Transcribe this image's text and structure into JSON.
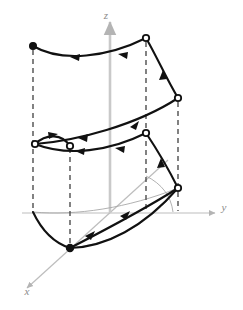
{
  "figure": {
    "title": "",
    "type": "3d-vector-field-surface-diagram",
    "background_color": "#ffffff",
    "curve_color": "#111111",
    "axis_color": "#b4b4b4",
    "dashed_color": "#4d4d4d",
    "thin_guide_color": "#a8a8a8"
  },
  "axes": {
    "z": {
      "label": "z",
      "label_x": 106,
      "label_y": 19,
      "from": [
        110,
        213
      ],
      "to": [
        110,
        22
      ],
      "arrow": "up"
    },
    "y": {
      "label": "y",
      "label_x": 224,
      "label_y": 211,
      "from": [
        22,
        213
      ],
      "to": [
        215,
        213
      ],
      "arrow": "right"
    },
    "x": {
      "label": "x",
      "label_x": 27,
      "label_y": 295,
      "from": [
        168,
        160
      ],
      "to": [
        27,
        288
      ],
      "arrow": "down-left"
    }
  },
  "vertices": [
    {
      "name": "top-left",
      "x": 33,
      "y": 46,
      "style": "filled"
    },
    {
      "name": "top-right",
      "x": 146,
      "y": 38,
      "style": "open"
    },
    {
      "name": "right-upper",
      "x": 178,
      "y": 98,
      "style": "open"
    },
    {
      "name": "mid-left-outer",
      "x": 35,
      "y": 144,
      "style": "open"
    },
    {
      "name": "mid-left-inner",
      "x": 70,
      "y": 146,
      "style": "open"
    },
    {
      "name": "mid-right",
      "x": 146,
      "y": 133,
      "style": "open"
    },
    {
      "name": "right-lower",
      "x": 178,
      "y": 188,
      "style": "open"
    },
    {
      "name": "bottom-front",
      "x": 70,
      "y": 248,
      "style": "filled"
    }
  ],
  "dashed_lines": [
    {
      "name": "dashed-left",
      "x": 33,
      "y1": 48,
      "y2": 212
    },
    {
      "name": "dashed-mid-left",
      "x": 70,
      "y1": 146,
      "y2": 246
    },
    {
      "name": "dashed-center-right",
      "x": 146,
      "y1": 40,
      "y2": 213
    },
    {
      "name": "dashed-far-right",
      "x": 178,
      "y1": 100,
      "y2": 212
    }
  ],
  "curves": [
    {
      "name": "top-edge-curve",
      "path": "M33,46 C62,62 108,57 146,38",
      "arrows": [
        {
          "t": 0.33,
          "dir": "left"
        },
        {
          "t": 0.74,
          "dir": "left"
        }
      ]
    },
    {
      "name": "top-right-descending-curve",
      "path": "M146,38 C158,58 166,78 178,98",
      "arrows": [
        {
          "t": 0.55,
          "dir": "up"
        }
      ]
    },
    {
      "name": "upper-diagonal-sweep",
      "path": "M35,144 C74,140 136,124 178,98",
      "arrows": [
        {
          "t": 0.42,
          "dir": "down-left"
        },
        {
          "t": 0.78,
          "dir": "up-right"
        }
      ]
    },
    {
      "name": "mid-horizontal-curve",
      "path": "M35,144 C68,156 110,150 146,133",
      "arrows": [
        {
          "t": 0.32,
          "dir": "left"
        },
        {
          "t": 0.7,
          "dir": "left"
        }
      ]
    },
    {
      "name": "mid-left-lens-upper",
      "path": "M35,144 C48,134 62,135 70,146",
      "arrows": [
        {
          "t": 0.4,
          "dir": "right"
        }
      ]
    },
    {
      "name": "mid-right-descending-curve",
      "path": "M146,133 C158,150 168,170 178,188",
      "arrows": [
        {
          "t": 0.5,
          "dir": "down"
        }
      ]
    },
    {
      "name": "lower-diagonal-sweep",
      "path": "M70,248 C102,232 146,208 178,188",
      "arrows": [
        {
          "t": 0.45,
          "dir": "up-right"
        }
      ]
    },
    {
      "name": "bottom-front-curve",
      "path": "M70,248 C108,240 150,220 178,188",
      "arrows": []
    },
    {
      "name": "bottom-left-hook",
      "path": "M33,212 C42,230 54,243 70,248",
      "arrows": []
    },
    {
      "name": "lower-back-curve",
      "path": "M70,248 C104,246 142,228 178,188",
      "arrows": []
    }
  ],
  "thin_guides": [
    {
      "name": "guide-back-lower",
      "path": "M33,212 C76,216 128,208 178,188"
    },
    {
      "name": "guide-right-arc",
      "path": "M146,178 C160,184 170,196 172,212"
    }
  ]
}
